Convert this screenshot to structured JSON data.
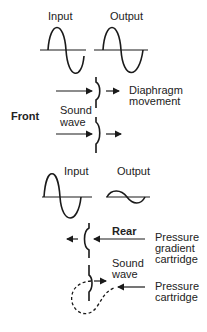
{
  "front_section": {
    "heading": "Front",
    "waveforms": {
      "input_label": "Input",
      "output_label": "Output"
    },
    "diaphragm_label_line1": "Diaphragm",
    "diaphragm_label_line2": "movement",
    "sound_wave_line1": "Sound",
    "sound_wave_line2": "wave"
  },
  "rear_section": {
    "heading": "Rear",
    "waveforms": {
      "input_label": "Input",
      "output_label": "Output"
    },
    "pressure_gradient_line1": "Pressure",
    "pressure_gradient_line2": "gradient",
    "pressure_gradient_line3": "cartridge",
    "sound_wave_line1": "Sound",
    "sound_wave_line2": "wave",
    "pressure_cartridge_line1": "Pressure",
    "pressure_cartridge_line2": "cartridge"
  },
  "colors": {
    "ink": "#1a1a1a",
    "background": "#ffffff"
  }
}
